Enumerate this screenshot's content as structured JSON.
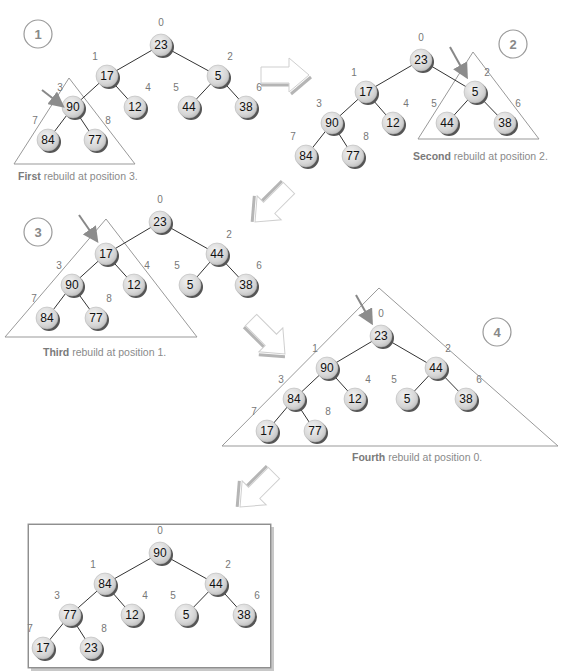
{
  "diagram": {
    "index_labels": [
      "0",
      "1",
      "2",
      "3",
      "4",
      "5",
      "6",
      "7",
      "8"
    ],
    "panels": [
      {
        "step": "1",
        "values": [
          "23",
          "17",
          "5",
          "90",
          "12",
          "44",
          "38",
          "84",
          "77"
        ],
        "caption_bold": "First",
        "caption_rest": " rebuild at position 3.",
        "highlight_position": 3
      },
      {
        "step": "2",
        "values": [
          "23",
          "17",
          "5",
          "90",
          "12",
          "44",
          "38",
          "84",
          "77"
        ],
        "caption_bold": "Second",
        "caption_rest": " rebuild at position 2.",
        "highlight_position": 2
      },
      {
        "step": "3",
        "values": [
          "23",
          "17",
          "44",
          "90",
          "12",
          "5",
          "38",
          "84",
          "77"
        ],
        "caption_bold": "Third",
        "caption_rest": " rebuild at position 1.",
        "highlight_position": 1
      },
      {
        "step": "4",
        "values": [
          "23",
          "90",
          "44",
          "84",
          "12",
          "5",
          "38",
          "17",
          "77"
        ],
        "caption_bold": "Fourth",
        "caption_rest": " rebuild at position 0.",
        "highlight_position": 0
      },
      {
        "step": "final",
        "values": [
          "90",
          "84",
          "44",
          "77",
          "12",
          "5",
          "38",
          "17",
          "23"
        ],
        "caption_bold": "",
        "caption_rest": "",
        "highlight_position": null
      }
    ],
    "colors": {
      "node_fill": "#d9d9d9",
      "node_shadow": "#555555",
      "edge": "#333333",
      "triangle": "#999999",
      "pointer_arrow": "#888888",
      "index_text": "#777777",
      "caption_text": "#8a8a8a"
    }
  }
}
